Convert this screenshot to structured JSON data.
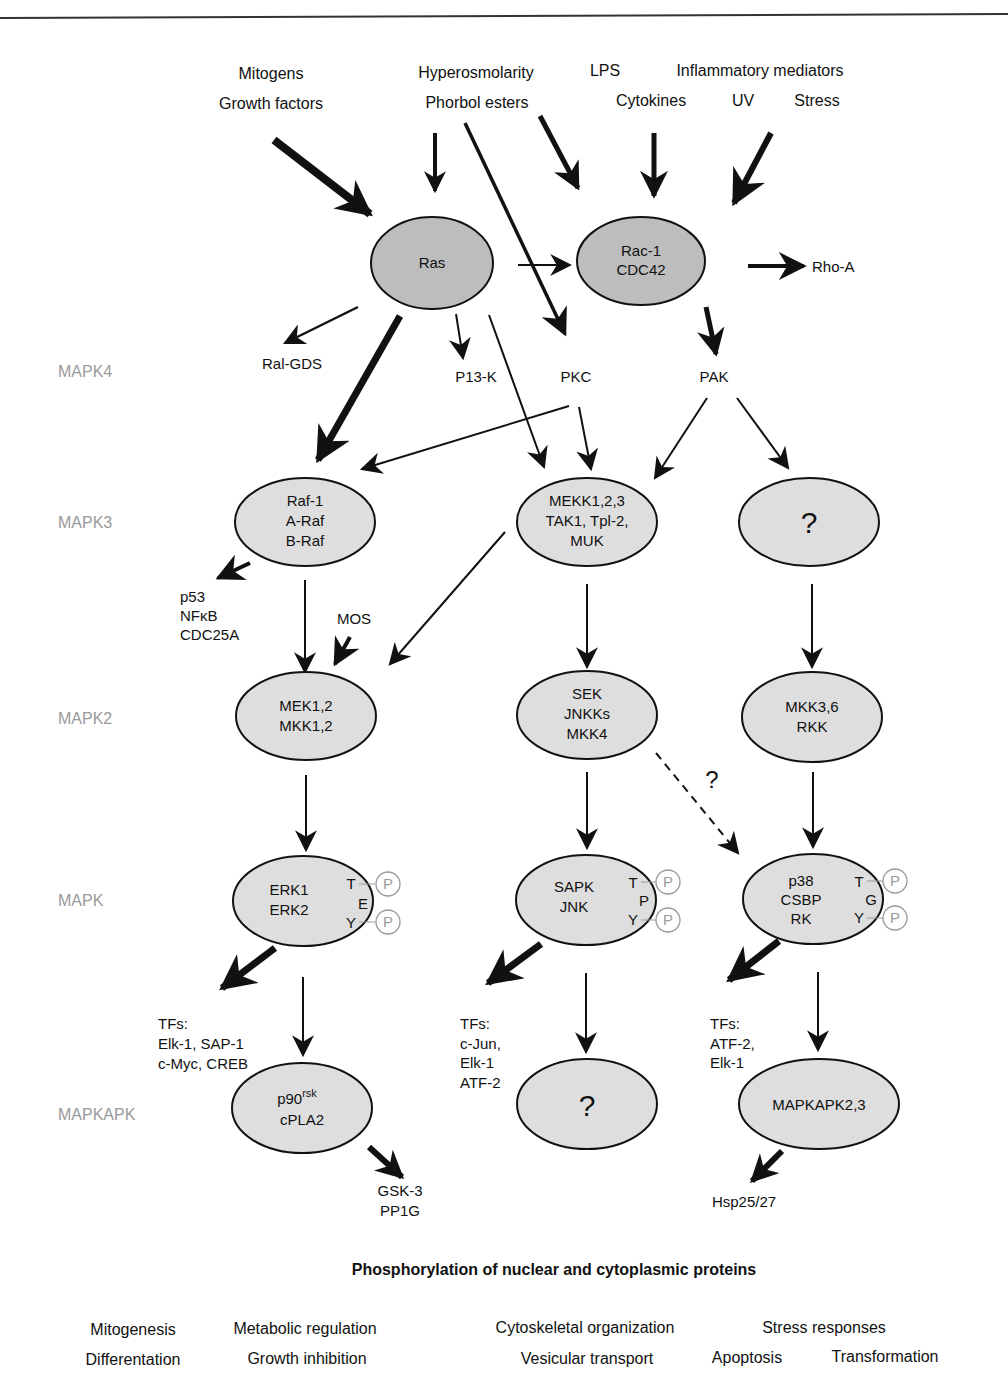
{
  "header": {
    "running_head_fragment": "",
    "rule": true
  },
  "stimuli": {
    "left": [
      "Mitogens",
      "Growth factors"
    ],
    "middle": [
      "Hyperosmolarity",
      "Phorbol esters"
    ],
    "right_row1": [
      "LPS",
      "Inflammatory mediators"
    ],
    "right_row2": [
      "Cytokines",
      "UV",
      "Stress"
    ]
  },
  "tiers": {
    "mapk4": "MAPK4",
    "mapk3": "MAPK3",
    "mapk2": "MAPK2",
    "mapk": "MAPK",
    "mapkapk": "MAPKAPK"
  },
  "nodes": {
    "ras": "Ras",
    "rac": [
      "Rac-1",
      "CDC42"
    ],
    "rho": "Rho-A",
    "ralgds": "Ral-GDS",
    "pi3k": "P13-K",
    "pkc": "PKC",
    "pak": "PAK",
    "raf": [
      "Raf-1",
      "A-Raf",
      "B-Raf"
    ],
    "mekk": [
      "MEKK1,2,3",
      "TAK1, Tpl-2,",
      "MUK"
    ],
    "mapk3_unknown": "?",
    "raf_targets": [
      "p53",
      "NFκB",
      "CDC25A"
    ],
    "mos": "MOS",
    "mek": [
      "MEK1,2",
      "MKK1,2"
    ],
    "sek": [
      "SEK",
      "JNKKs",
      "MKK4"
    ],
    "mkk36": [
      "MKK3,6",
      "RKK"
    ],
    "dashed_question": "?",
    "erk": {
      "names": [
        "ERK1",
        "ERK2"
      ],
      "motif": [
        "T",
        "E",
        "Y"
      ]
    },
    "sapk": {
      "names": [
        "SAPK",
        "JNK"
      ],
      "motif": [
        "T",
        "P",
        "Y"
      ]
    },
    "p38": {
      "names": [
        "p38",
        "CSBP",
        "RK"
      ],
      "motif": [
        "T",
        "G",
        "Y"
      ]
    },
    "phospho": "P",
    "erk_tfs": [
      "TFs:",
      "Elk-1, SAP-1",
      "c-Myc, CREB"
    ],
    "sapk_tfs": [
      "TFs:",
      "c-Jun,",
      "Elk-1",
      "ATF-2"
    ],
    "p38_tfs": [
      "TFs:",
      "ATF-2,",
      "Elk-1"
    ],
    "p90": {
      "base": "p90",
      "sup": "rsk",
      "line2": "cPLA2"
    },
    "mapkapk_unknown": "?",
    "mapkapk23": "MAPKAPK2,3",
    "gsk": [
      "GSK-3",
      "PP1G"
    ],
    "hsp": "Hsp25/27"
  },
  "footer": {
    "title": "Phosphorylation of nuclear and cytoplasmic proteins",
    "outcomes_row1": [
      "Mitogenesis",
      "Metabolic regulation",
      "Cytoskeletal organization",
      "Stress responses"
    ],
    "outcomes_row2": [
      "Differentation",
      "Growth inhibition",
      "Vesicular transport",
      "Apoptosis",
      "Transformation"
    ]
  },
  "colors": {
    "node_dark": "#bdbdbd",
    "node_light": "#dedede",
    "tier_label": "#9a9a9a",
    "ink": "#111111"
  }
}
